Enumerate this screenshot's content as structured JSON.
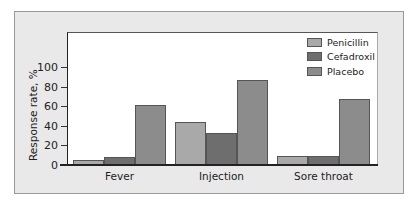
{
  "chart_data": {
    "type": "bar",
    "title": "",
    "xlabel": "",
    "ylabel": "Response rate, %",
    "ylim": [
      0,
      100
    ],
    "yticks": [
      0,
      20,
      40,
      60,
      80,
      100
    ],
    "grid": false,
    "legend_position": "top-right",
    "categories": [
      "Fever",
      "Injection",
      "Sore throat"
    ],
    "series": [
      {
        "name": "Penicillin",
        "color": "#a9a9a9",
        "values": [
          5,
          44,
          9
        ]
      },
      {
        "name": "Cefadroxil",
        "color": "#6e6e6e",
        "values": [
          8,
          33,
          9
        ]
      },
      {
        "name": "Placebo",
        "color": "#8c8c8c",
        "values": [
          61,
          87,
          67
        ]
      }
    ]
  },
  "axis": {
    "ylabel": "Response rate, %",
    "ticks": [
      "0",
      "20",
      "40",
      "60",
      "80",
      "100"
    ]
  },
  "categories": [
    "Fever",
    "Injection",
    "Sore throat"
  ],
  "legend": [
    "Penicillin",
    "Cefadroxil",
    "Placebo"
  ]
}
